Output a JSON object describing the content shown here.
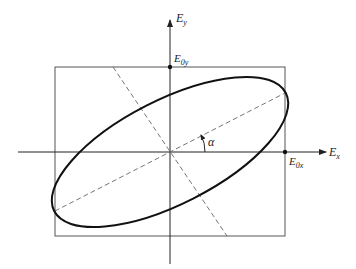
{
  "diagram": {
    "axes": {
      "x_label": "E",
      "x_sub": "x",
      "y_label": "E",
      "y_sub": "y"
    },
    "marks": {
      "x_amp_label": "E",
      "x_amp_sub": "0x",
      "y_amp_label": "E",
      "y_amp_sub": "0y"
    },
    "angle_label": "α",
    "colors": {
      "ellipse": "#111111",
      "box": "#555555",
      "axes": "#222222",
      "dashed": "#666666"
    }
  }
}
